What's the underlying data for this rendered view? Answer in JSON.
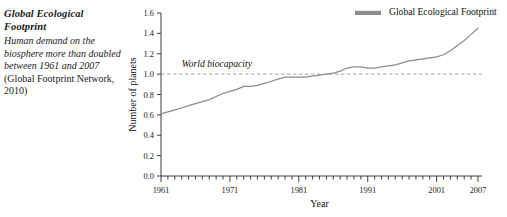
{
  "caption": {
    "title": "Global Ecological Footprint",
    "body_italic": "Human demand on the biosphere more than doubled between 1961 and 2007 ",
    "body_roman": "(Global Footprint Network, 2010)"
  },
  "colors": {
    "series_line": "#8c8c8c",
    "biocapacity_line": "#9a9a9a",
    "axis": "#2b2b2b",
    "text": "#1a1a1a"
  },
  "chart_data": {
    "type": "line",
    "title": "",
    "xlabel": "Year",
    "ylabel": "Number of planets",
    "xlim": [
      1961,
      2007
    ],
    "ylim": [
      0.0,
      1.6
    ],
    "grid": false,
    "legend_position": "top-right",
    "x_tick_labels": [
      "1961",
      "1971",
      "1981",
      "1991",
      "2001",
      "2007"
    ],
    "x_tick_values": [
      1961,
      1971,
      1981,
      1991,
      2001,
      2007
    ],
    "x_minor_tick_step": 1,
    "y_tick_labels": [
      "0.0",
      "0.2",
      "0.4",
      "0.6",
      "0.8",
      "1.0",
      "1.2",
      "1.4",
      "1.6"
    ],
    "y_tick_values": [
      0.0,
      0.2,
      0.4,
      0.6,
      0.8,
      1.0,
      1.2,
      1.4,
      1.6
    ],
    "annotations": [
      {
        "name": "world-biocapacity",
        "text": "World biocapacity",
        "x": 1964,
        "y": 1.07,
        "type": "reference-line-label"
      }
    ],
    "reference_lines": [
      {
        "name": "world-biocapacity-line",
        "label": "World biocapacity",
        "value": 1.0,
        "orientation": "horizontal",
        "style": "dashed"
      }
    ],
    "series": [
      {
        "name": "Global Ecological Footprint",
        "legend_label": "Global Ecological Footprint",
        "x": [
          1961,
          1962,
          1963,
          1964,
          1965,
          1966,
          1967,
          1968,
          1969,
          1970,
          1971,
          1972,
          1973,
          1974,
          1975,
          1976,
          1977,
          1978,
          1979,
          1980,
          1981,
          1982,
          1983,
          1984,
          1985,
          1986,
          1987,
          1988,
          1989,
          1990,
          1991,
          1992,
          1993,
          1994,
          1995,
          1996,
          1997,
          1998,
          1999,
          2000,
          2001,
          2002,
          2003,
          2004,
          2005,
          2006,
          2007
        ],
        "values": [
          0.61,
          0.63,
          0.65,
          0.67,
          0.69,
          0.71,
          0.73,
          0.75,
          0.78,
          0.81,
          0.83,
          0.85,
          0.88,
          0.88,
          0.89,
          0.91,
          0.93,
          0.95,
          0.97,
          0.97,
          0.97,
          0.97,
          0.98,
          0.99,
          1.0,
          1.01,
          1.03,
          1.06,
          1.07,
          1.07,
          1.06,
          1.06,
          1.07,
          1.08,
          1.09,
          1.11,
          1.13,
          1.14,
          1.15,
          1.16,
          1.17,
          1.19,
          1.23,
          1.28,
          1.33,
          1.39,
          1.45
        ]
      }
    ]
  }
}
